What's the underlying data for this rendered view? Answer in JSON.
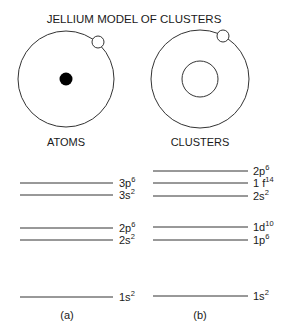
{
  "title": "JELLIUM MODEL OF CLUSTERS",
  "panels": [
    {
      "id": "a",
      "caption": "ATOMS",
      "sublabel": "(a)",
      "core": "filled-nucleus",
      "levels": [
        {
          "orbital": "3p",
          "occupancy": "6",
          "y": 183
        },
        {
          "orbital": "3s",
          "occupancy": "2",
          "y": 195
        },
        {
          "orbital": "2p",
          "occupancy": "6",
          "y": 228
        },
        {
          "orbital": "2s",
          "occupancy": "2",
          "y": 240
        },
        {
          "orbital": "1s",
          "occupancy": "2",
          "y": 297
        }
      ]
    },
    {
      "id": "b",
      "caption": "CLUSTERS",
      "sublabel": "(b)",
      "core": "jellium-ring",
      "levels": [
        {
          "orbital": "2p",
          "occupancy": "6",
          "y": 171
        },
        {
          "orbital": "1 f",
          "occupancy": "14",
          "y": 183
        },
        {
          "orbital": "2s",
          "occupancy": "2",
          "y": 196
        },
        {
          "orbital": "1d",
          "occupancy": "10",
          "y": 227
        },
        {
          "orbital": "1p",
          "occupancy": "6",
          "y": 240
        },
        {
          "orbital": "1s",
          "occupancy": "2",
          "y": 296
        }
      ]
    }
  ],
  "colors": {
    "stroke": "#333333",
    "text": "#1a1a1a",
    "background": "#ffffff"
  }
}
